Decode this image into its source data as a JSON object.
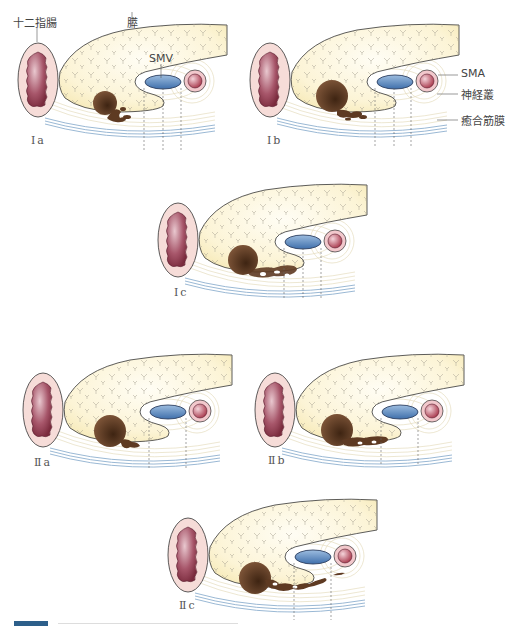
{
  "labels": {
    "duodenum": "十二指腸",
    "pancreas": "膵",
    "smv": "SMV",
    "sma": "SMA",
    "nerve_plexus": "神経叢",
    "fusion_fascia": "癒合筋膜"
  },
  "panels": [
    {
      "id": "Ia",
      "label": "Ⅰa"
    },
    {
      "id": "Ib",
      "label": "Ⅰb"
    },
    {
      "id": "Ic",
      "label": "Ⅰc"
    },
    {
      "id": "IIa",
      "label": "Ⅱa"
    },
    {
      "id": "IIb",
      "label": "Ⅱb"
    },
    {
      "id": "IIc",
      "label": "Ⅱc"
    }
  ],
  "colors": {
    "pancreas_fill": "#f7eab8",
    "duodenum_outer": "#f6dcd8",
    "duodenum_inner": "#8e3b4c",
    "smv": "#4f7fb8",
    "sma": "#b94a5c",
    "tumor": "#5e3a22",
    "fascia": "#7ea4c8",
    "plexus": "#d9cfa6"
  }
}
